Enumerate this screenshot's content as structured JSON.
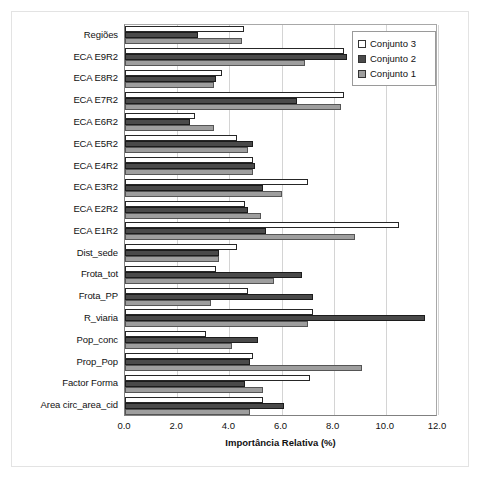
{
  "chart_data": {
    "type": "bar",
    "orientation": "horizontal",
    "title": "",
    "xlabel": "Importância Relativa (%)",
    "ylabel": "",
    "xlim": [
      0.0,
      12.0
    ],
    "xticks": [
      "0.0",
      "2.0",
      "4.0",
      "6.0",
      "8.0",
      "10.0",
      "12.0"
    ],
    "xtick_values": [
      0.0,
      2.0,
      4.0,
      6.0,
      8.0,
      10.0,
      12.0
    ],
    "grid": true,
    "grid_axis": "x",
    "legend_position": "top-right",
    "categories": [
      "Regiões",
      "ECA E9R2",
      "ECA E8R2",
      "ECA E7R2",
      "ECA E6R2",
      "ECA E5R2",
      "ECA E4R2",
      "ECA E3R2",
      "ECA E2R2",
      "ECA E1R2",
      "Dist_sede",
      "Frota_tot",
      "Frota_PP",
      "R_viaria",
      "Pop_conc",
      "Prop_Pop",
      "Factor Forma",
      "Area circ_area_cid"
    ],
    "series": [
      {
        "name": "Conjunto 3",
        "color": "#ffffff",
        "values": [
          4.55,
          8.4,
          3.7,
          8.4,
          2.7,
          4.3,
          4.9,
          7.0,
          4.6,
          10.5,
          4.3,
          3.5,
          4.7,
          7.2,
          3.1,
          4.9,
          7.1,
          5.3
        ]
      },
      {
        "name": "Conjunto 2",
        "color": "#4a4a4a",
        "values": [
          2.8,
          8.5,
          3.5,
          6.6,
          2.5,
          4.9,
          5.0,
          5.3,
          4.7,
          5.4,
          3.6,
          6.8,
          7.2,
          11.5,
          5.1,
          4.8,
          4.6,
          6.1
        ]
      },
      {
        "name": "Conjunto 1",
        "color": "#9e9e9e",
        "values": [
          4.5,
          6.9,
          3.4,
          8.3,
          3.4,
          4.7,
          4.9,
          6.0,
          5.2,
          8.8,
          3.6,
          5.7,
          3.3,
          7.0,
          4.1,
          9.1,
          5.3,
          4.8
        ]
      }
    ]
  },
  "legend": {
    "items": [
      {
        "label": "Conjunto 3",
        "swatch": "s3"
      },
      {
        "label": "Conjunto 2",
        "swatch": "s2"
      },
      {
        "label": "Conjunto 1",
        "swatch": "s1"
      }
    ]
  }
}
